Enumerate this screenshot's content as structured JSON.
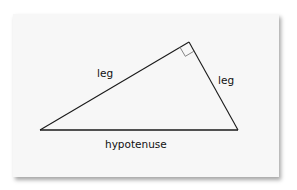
{
  "diagram": {
    "type": "right-triangle",
    "labels": {
      "leg_left": "leg",
      "leg_right": "leg",
      "hypotenuse": "hypotenuse"
    },
    "vertices": {
      "left": [
        40,
        130
      ],
      "right": [
        238,
        130
      ],
      "top": [
        189,
        42
      ]
    },
    "right_angle_marker": "top",
    "colors": {
      "card": "#f7f7f7",
      "line": "#1a1a1a",
      "marker": "#777777"
    }
  }
}
